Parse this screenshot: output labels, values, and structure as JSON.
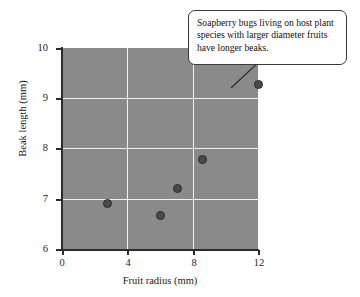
{
  "chart_data": {
    "type": "scatter",
    "title": "",
    "xlabel": "Fruit radius (mm)",
    "ylabel": "Beak length (mm)",
    "xlim": [
      0,
      12
    ],
    "ylim": [
      6,
      10
    ],
    "xticks": [
      "0",
      "4",
      "8",
      "12"
    ],
    "yticks": [
      "6",
      "7",
      "8",
      "9",
      "10"
    ],
    "grid": true,
    "legend": "none",
    "points": [
      {
        "x": 2.8,
        "y": 6.9
      },
      {
        "x": 6.0,
        "y": 6.67
      },
      {
        "x": 7.1,
        "y": 7.2
      },
      {
        "x": 8.6,
        "y": 7.78
      },
      {
        "x": 12.0,
        "y": 9.27
      }
    ],
    "annotations": [
      {
        "name": "trend-callout",
        "text": "Soapberry bugs living on host plant species with larger diameter fruits have longer beaks.",
        "points_to": {
          "x": 12.0,
          "y": 9.27
        }
      }
    ],
    "colors": {
      "plot_background": "#8a8a8a",
      "gridlines": "#f2f2f2",
      "marker_fill": "#4a4a4a",
      "marker_edge": "#2a2a2a",
      "axis": "#2b2b2b",
      "figure_background": "#ffffff",
      "callout_background": "#ffffff",
      "callout_border": "#3a3a3a"
    }
  }
}
